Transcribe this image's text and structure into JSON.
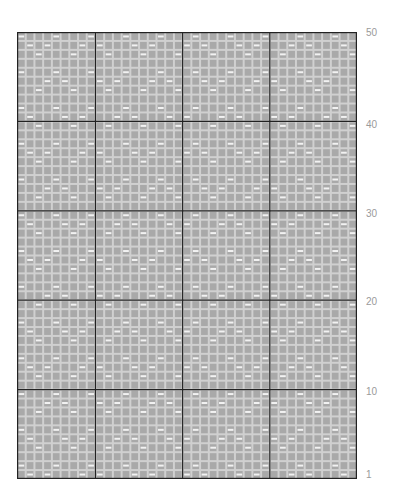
{
  "chart_grid": {
    "columns": 39,
    "rows": 50,
    "section_column_breaks": [
      9,
      19,
      29
    ],
    "section_row_breaks": [
      10,
      20,
      30,
      40
    ],
    "colors": {
      "background": "#ffffff",
      "cell_fill": "#a9a9a9",
      "cell_border": "#d0d0d0",
      "dash_symbol": "#f2f2f2",
      "major_line": "#222222",
      "label": "#9a9a9a"
    },
    "symbol_legend": {
      "empty": "gray-square",
      "dash": "white-horizontal-dash"
    }
  },
  "row_labels": [
    {
      "text": "50",
      "row": 50
    },
    {
      "text": "40",
      "row": 40
    },
    {
      "text": "30",
      "row": 30
    },
    {
      "text": "20",
      "row": 20
    },
    {
      "text": "10",
      "row": 10
    },
    {
      "text": "1",
      "row": 1
    }
  ]
}
